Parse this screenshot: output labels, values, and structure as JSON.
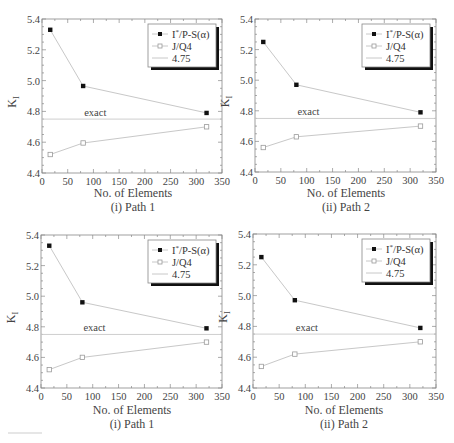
{
  "figure": {
    "panels": [
      {
        "x_label": "No. of Elements",
        "caption": "(i) Path 1"
      },
      {
        "x_label": "No. of Elements",
        "caption": "(ii) Path 2"
      },
      {
        "x_label": "No. of Elements",
        "caption": "(i) Path 1"
      },
      {
        "x_label": "No. of Elements",
        "caption": "(ii) Path 2"
      }
    ]
  },
  "chart_data": [
    {
      "type": "line",
      "title": "(i) Path 1",
      "xlabel": "No. of Elements",
      "ylabel": "K_I",
      "xlim": [
        0,
        350
      ],
      "ylim": [
        4.4,
        5.4
      ],
      "xticks": [
        0,
        50,
        100,
        150,
        200,
        250,
        300,
        350
      ],
      "yticks": [
        "4.4",
        "4.6",
        "4.8",
        "5.0",
        "5.2",
        "5.4"
      ],
      "x": [
        16,
        80,
        320
      ],
      "series": [
        {
          "name": "I*/P-S(α)",
          "marker": "filled-square",
          "values": [
            5.33,
            4.965,
            4.79
          ]
        },
        {
          "name": "J/Q4",
          "marker": "open-square",
          "values": [
            4.52,
            4.595,
            4.7
          ]
        }
      ],
      "reference_line": {
        "name": "4.75",
        "value": 4.75,
        "annotation": "exact"
      },
      "legend": [
        "I*/P-S(α)",
        "J/Q4",
        "4.75"
      ],
      "legend_position": "upper right",
      "grid": false
    },
    {
      "type": "line",
      "title": "(ii) Path 2",
      "xlabel": "No. of Elements",
      "ylabel": "K_I",
      "xlim": [
        0,
        350
      ],
      "ylim": [
        4.4,
        5.4
      ],
      "xticks": [
        0,
        50,
        100,
        150,
        200,
        250,
        300,
        350
      ],
      "yticks": [
        "4.4",
        "4.6",
        "4.8",
        "5.0",
        "5.2",
        "5.4"
      ],
      "x": [
        16,
        80,
        320
      ],
      "series": [
        {
          "name": "I*/P-S(α)",
          "marker": "filled-square",
          "values": [
            5.25,
            4.97,
            4.79
          ]
        },
        {
          "name": "J/Q4",
          "marker": "open-square",
          "values": [
            4.56,
            4.63,
            4.7
          ]
        }
      ],
      "reference_line": {
        "name": "4.75",
        "value": 4.75,
        "annotation": "exact"
      },
      "legend": [
        "I*/P-S(α)",
        "J/Q4",
        "4.75"
      ],
      "legend_position": "upper right",
      "grid": false
    },
    {
      "type": "line",
      "title": "(i) Path 1",
      "xlabel": "No. of Elements",
      "ylabel": "K_I",
      "xlim": [
        0,
        350
      ],
      "ylim": [
        4.4,
        5.4
      ],
      "xticks": [
        0,
        50,
        100,
        150,
        200,
        250,
        300,
        350
      ],
      "yticks": [
        "4.4",
        "4.6",
        "4.8",
        "5.0",
        "5.2",
        "5.4"
      ],
      "x": [
        16,
        80,
        320
      ],
      "series": [
        {
          "name": "I*/P-S(α)",
          "marker": "filled-square",
          "values": [
            5.33,
            4.96,
            4.79
          ]
        },
        {
          "name": "J/Q4",
          "marker": "open-square",
          "values": [
            4.52,
            4.6,
            4.7
          ]
        }
      ],
      "reference_line": {
        "name": "4.75",
        "value": 4.75,
        "annotation": "exact"
      },
      "legend": [
        "I*/P-S(α)",
        "J/Q4",
        "4.75"
      ],
      "legend_position": "upper right",
      "grid": false
    },
    {
      "type": "line",
      "title": "(ii) Path 2",
      "xlabel": "No. of Elements",
      "ylabel": "K_I",
      "xlim": [
        0,
        350
      ],
      "ylim": [
        4.4,
        5.4
      ],
      "xticks": [
        0,
        50,
        100,
        150,
        200,
        250,
        300,
        350
      ],
      "yticks": [
        "4.4",
        "4.6",
        "4.8",
        "5.0",
        "5.2",
        "5.4"
      ],
      "x": [
        16,
        80,
        320
      ],
      "series": [
        {
          "name": "I*/P-S(α)",
          "marker": "filled-square",
          "values": [
            5.25,
            4.97,
            4.79
          ]
        },
        {
          "name": "J/Q4",
          "marker": "open-square",
          "values": [
            4.54,
            4.62,
            4.7
          ]
        }
      ],
      "reference_line": {
        "name": "4.75",
        "value": 4.75,
        "annotation": "exact"
      },
      "legend": [
        "I*/P-S(α)",
        "J/Q4",
        "4.75"
      ],
      "legend_position": "upper right",
      "grid": false
    }
  ],
  "colors": {
    "axis": "#888888",
    "series_line": "#c8c8c8",
    "filled_marker": "#111111",
    "open_marker": "#9a9a9a",
    "reference_line": "#c8c8c8",
    "legend_shadow": "#111111"
  }
}
